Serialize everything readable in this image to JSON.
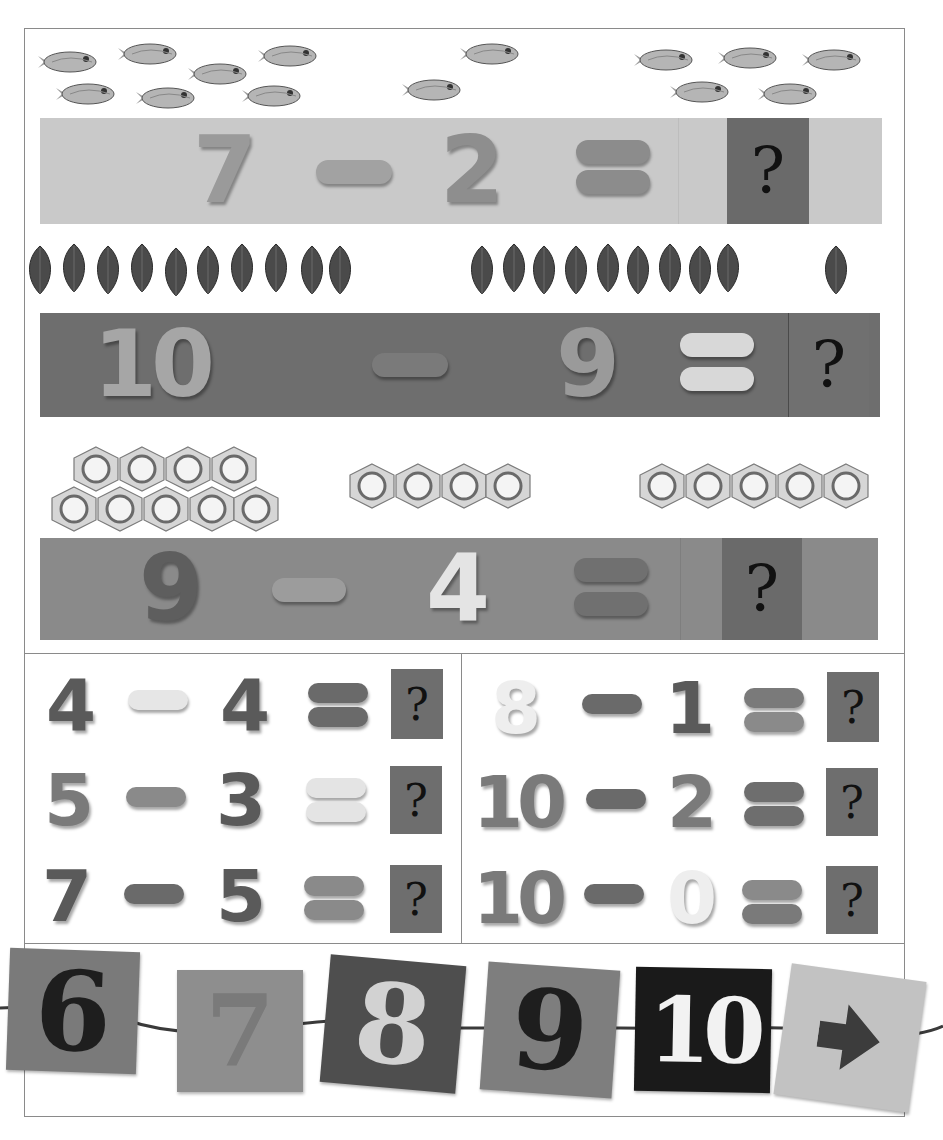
{
  "colors": {
    "border": "#8a8a8a",
    "strip1_bg": "#c9c9c9",
    "strip2_bg": "#6e6e6e",
    "strip3_bg": "#8a8a8a",
    "qbox_dark": "#6a6a6a",
    "qbox_mid": "#777777"
  },
  "big_problems": [
    {
      "counter_type": "fish-icon",
      "counter_groups": [
        7,
        1,
        5
      ],
      "minuend": "7",
      "operator": "−",
      "subtrahend": "2",
      "equals": "=",
      "answer": "?"
    },
    {
      "counter_type": "leaf-icon",
      "counter_groups": [
        10,
        9,
        1
      ],
      "minuend": "10",
      "operator": "−",
      "subtrahend": "9",
      "equals": "=",
      "answer": "?"
    },
    {
      "counter_type": "hex-nut-icon",
      "counter_groups": [
        9,
        4,
        5
      ],
      "minuend": "9",
      "operator": "−",
      "subtrahend": "4",
      "equals": "=",
      "answer": "?"
    }
  ],
  "small_problems": {
    "left": [
      {
        "minuend": "4",
        "subtrahend": "4",
        "answer": "?"
      },
      {
        "minuend": "5",
        "subtrahend": "3",
        "answer": "?"
      },
      {
        "minuend": "7",
        "subtrahend": "5",
        "answer": "?"
      }
    ],
    "right": [
      {
        "minuend": "8",
        "subtrahend": "1",
        "answer": "?"
      },
      {
        "minuend": "10",
        "subtrahend": "2",
        "answer": "?"
      },
      {
        "minuend": "10",
        "subtrahend": "0",
        "answer": "?"
      }
    ]
  },
  "number_line_tags": [
    "6",
    "7",
    "8",
    "9",
    "10",
    "➜"
  ]
}
